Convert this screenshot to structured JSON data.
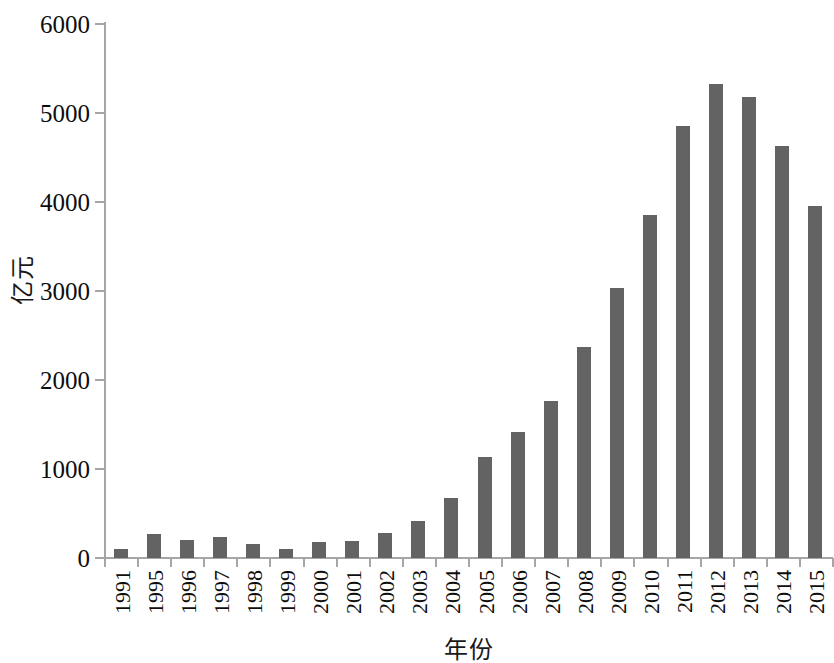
{
  "chart_data": {
    "type": "bar",
    "title": "",
    "subtitle": "",
    "xlabel": "年份",
    "ylabel": "亿元",
    "categories": [
      "1991",
      "1995",
      "1996",
      "1997",
      "1998",
      "1999",
      "2000",
      "2001",
      "2002",
      "2003",
      "2004",
      "2005",
      "2006",
      "2007",
      "2008",
      "2009",
      "2010",
      "2011",
      "2012",
      "2013",
      "2014",
      "2015"
    ],
    "values": [
      100,
      275,
      200,
      240,
      160,
      105,
      180,
      195,
      280,
      420,
      670,
      1140,
      1420,
      1765,
      2375,
      3030,
      3850,
      4855,
      5330,
      5180,
      4630,
      3960
    ],
    "series": [
      {
        "name": "亿元",
        "values": [
          100,
          275,
          200,
          240,
          160,
          105,
          180,
          195,
          280,
          420,
          670,
          1140,
          1420,
          1765,
          2375,
          3030,
          3850,
          4855,
          5330,
          5180,
          4630,
          3960
        ]
      }
    ],
    "ylim": [
      0,
      6000
    ],
    "ytick_labels": [
      "0",
      "1000",
      "2000",
      "3000",
      "4000",
      "5000",
      "6000"
    ],
    "ytick_values": [
      0,
      1000,
      2000,
      3000,
      4000,
      5000,
      6000
    ],
    "grid": false,
    "legend": false,
    "legend_position": "none",
    "bar_color": "#636363",
    "axis_color": "#a6a6a6",
    "background_color": "#ffffff"
  },
  "axes": {
    "y_title": "亿元",
    "x_title": "年份"
  }
}
